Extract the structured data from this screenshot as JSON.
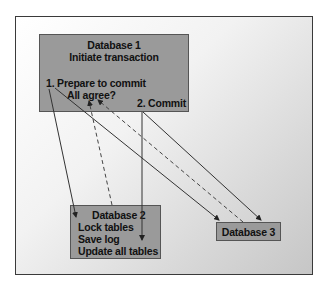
{
  "diagram": {
    "type": "two-phase commit flow",
    "database1": {
      "title": "Database 1",
      "subtitle": "Initiate transaction",
      "step1": "1. Prepare to commit",
      "step1_question": "All agree?",
      "step2": "2. Commit"
    },
    "database2": {
      "title": "Database 2",
      "lines": [
        "Lock tables",
        "Save log",
        "Update all tables"
      ]
    },
    "database3": {
      "title": "Database 3"
    },
    "arrows": [
      {
        "from": "Database 1 (Prepare to commit)",
        "to": "Database 2",
        "style": "solid"
      },
      {
        "from": "Database 1 (Prepare to commit)",
        "to": "Database 3",
        "style": "solid"
      },
      {
        "from": "Database 2",
        "to": "Database 1 (All agree?)",
        "style": "dashed"
      },
      {
        "from": "Database 3",
        "to": "Database 1 (All agree?)",
        "style": "dashed"
      },
      {
        "from": "Database 1 (Commit)",
        "to": "Database 2",
        "style": "solid"
      },
      {
        "from": "Database 1 (Commit)",
        "to": "Database 3",
        "style": "solid"
      }
    ],
    "colors": {
      "box_fill": "#9a9a9a",
      "border": "#3a3a3a",
      "text": "#111111"
    }
  }
}
